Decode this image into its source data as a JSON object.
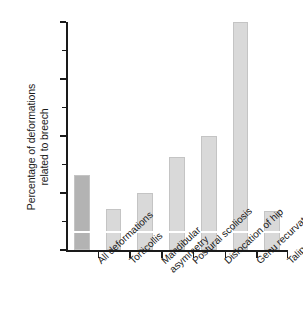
{
  "chart_data": {
    "type": "bar",
    "title": "",
    "xlabel": "",
    "ylabel": "Percentage of deformations related to breech",
    "ylabel_lines": [
      "Percentage of deformations",
      "related to breech"
    ],
    "categories": [
      "All deformations",
      "Torticollis",
      "Mandibular asymmetry",
      "Postural scoliosis",
      "Dislocation of hip",
      "Genu recurvatum",
      "Talipes"
    ],
    "category_lines": [
      [
        "All deformations"
      ],
      [
        "Torticollis"
      ],
      [
        "Mandibular",
        "asymmetry"
      ],
      [
        "Postural scoliosis"
      ],
      [
        "Dislocation of hip"
      ],
      [
        "Genu recurvatum"
      ],
      [
        "Talipes"
      ]
    ],
    "values": [
      33,
      18,
      25,
      41,
      50,
      100,
      17
    ],
    "baseline_marker_values": [
      7.5,
      7.5,
      7.5,
      7.5,
      7.5,
      7.5,
      7.5
    ],
    "ylim": [
      0,
      100
    ],
    "y_ticks_major": [
      0,
      25,
      50,
      75,
      100
    ],
    "y_tick_labels": [
      "0",
      "25",
      "50",
      "75",
      "100"
    ],
    "y_ticks_minor": [
      12.5,
      37.5,
      62.5,
      87.5
    ],
    "grid": false,
    "legend": "none",
    "bar_colors": [
      "#b3b3b3",
      "#d9d9d9",
      "#d9d9d9",
      "#d9d9d9",
      "#d9d9d9",
      "#d9d9d9",
      "#d9d9d9"
    ],
    "bar_edge_color": "#c4c4c4",
    "inner_line_color": "#ffffff",
    "axis_color": "#1a1a1a",
    "background": "#ffffff"
  }
}
